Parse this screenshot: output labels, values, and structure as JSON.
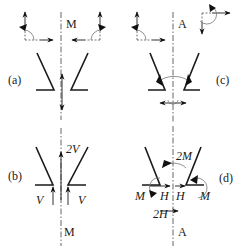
{
  "figure": {
    "panels": [
      {
        "id": "a",
        "label": "(a)",
        "axis_label": "M"
      },
      {
        "id": "b",
        "label": "(b)",
        "axis_label": "M",
        "forces": [
          "2V",
          "V",
          "V"
        ]
      },
      {
        "id": "c",
        "label": "(c)",
        "axis_label": "A"
      },
      {
        "id": "d",
        "label": "(d)",
        "axis_label": "A",
        "forces": [
          "2M",
          "M",
          "M",
          "H",
          "H",
          "2H"
        ]
      }
    ],
    "labels": {
      "a": "(a)",
      "b": "(b)",
      "c": "(c)",
      "d": "(d)",
      "axis_a": "M",
      "axis_b": "M",
      "axis_c": "A",
      "axis_d": "A",
      "b_2v": "2V",
      "b_v_left": "V",
      "b_v_right": "V",
      "d_2m": "2M",
      "d_m_left": "M",
      "d_m_right": "M",
      "d_h_left": "H",
      "d_h_right": "H",
      "d_2h": "2H"
    },
    "colors": {
      "ink": "#1a1a1a",
      "axis": "#555555",
      "background": "#ffffff"
    }
  }
}
